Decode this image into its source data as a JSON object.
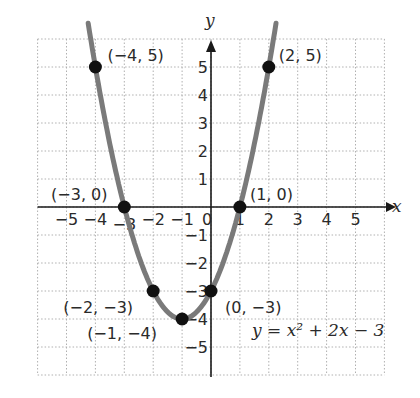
{
  "chart_data": {
    "type": "line",
    "title": "",
    "equation": "y = x² + 2x − 3",
    "xlabel": "x",
    "ylabel": "y",
    "xlim": [
      -6,
      6
    ],
    "ylim": [
      -6,
      6
    ],
    "grid": true,
    "x_ticks": [
      "−5",
      "−4",
      "−3",
      "−2",
      "−1",
      "0",
      "1",
      "2",
      "3",
      "4",
      "5"
    ],
    "y_ticks": [
      "5",
      "4",
      "3",
      "2",
      "1",
      "−1",
      "−2",
      "−3",
      "−4",
      "−5"
    ],
    "series": [
      {
        "name": "y = x^2 + 2x - 3",
        "curve": "parabola",
        "color": "#7a7a7a",
        "points": [
          {
            "x": -4,
            "y": 5,
            "label": "(−4, 5)"
          },
          {
            "x": -3,
            "y": 0,
            "label": "(−3, 0)"
          },
          {
            "x": -2,
            "y": -3,
            "label": "(−2, −3)"
          },
          {
            "x": -1,
            "y": -4,
            "label": "(−1, −4)"
          },
          {
            "x": 0,
            "y": -3,
            "label": "(0, −3)"
          },
          {
            "x": 1,
            "y": 0,
            "label": "(1, 0)"
          },
          {
            "x": 2,
            "y": 5,
            "label": "(2, 5)"
          }
        ]
      }
    ]
  },
  "colors": {
    "curve": "#7a7a7a",
    "points": "#111111",
    "axes": "#1a1a1a",
    "grid": "#b0b0b0"
  }
}
